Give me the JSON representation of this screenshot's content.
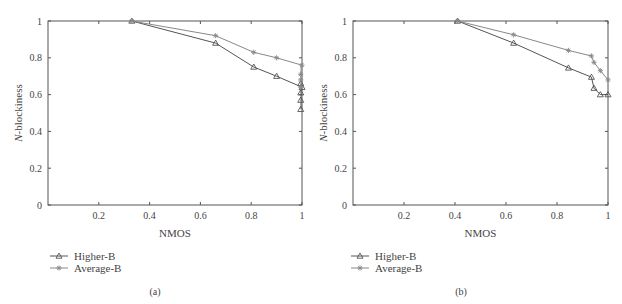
{
  "chart_data": [
    {
      "type": "line",
      "panel_label": "(a)",
      "title": "",
      "xlabel": "NMOS",
      "ylabel": "N-blockiness",
      "xlim": [
        0,
        1
      ],
      "ylim": [
        0,
        1
      ],
      "xticks": [
        "0.2",
        "0.4",
        "0.6",
        "0.8",
        "1"
      ],
      "yticks": [
        "0",
        "0.2",
        "0.4",
        "0.6",
        "0.8",
        "1"
      ],
      "grid": false,
      "legend_position": "below-left",
      "series": [
        {
          "name": "Higher-B",
          "marker": "triangle",
          "points": [
            [
              0.33,
              1.0
            ],
            [
              0.66,
              0.88
            ],
            [
              0.81,
              0.75
            ],
            [
              0.9,
              0.7
            ],
            [
              1.0,
              0.64
            ],
            [
              0.995,
              0.66
            ],
            [
              0.995,
              0.61
            ],
            [
              0.995,
              0.57
            ],
            [
              0.995,
              0.52
            ]
          ]
        },
        {
          "name": "Average-B",
          "marker": "star",
          "points": [
            [
              0.33,
              1.0
            ],
            [
              0.66,
              0.92
            ],
            [
              0.81,
              0.83
            ],
            [
              0.9,
              0.8
            ],
            [
              1.0,
              0.76
            ],
            [
              0.995,
              0.71
            ],
            [
              0.995,
              0.68
            ],
            [
              0.995,
              0.64
            ]
          ]
        }
      ]
    },
    {
      "type": "line",
      "panel_label": "(b)",
      "title": "",
      "xlabel": "NMOS",
      "ylabel": "N-blockiness",
      "xlim": [
        0,
        1
      ],
      "ylim": [
        0,
        1
      ],
      "xticks": [
        "0.2",
        "0.4",
        "0.6",
        "0.8",
        "1"
      ],
      "yticks": [
        "0",
        "0.2",
        "0.4",
        "0.6",
        "0.8",
        "1"
      ],
      "grid": false,
      "legend_position": "below-left",
      "series": [
        {
          "name": "Higher-B",
          "marker": "triangle",
          "points": [
            [
              0.41,
              1.0
            ],
            [
              0.63,
              0.88
            ],
            [
              0.845,
              0.745
            ],
            [
              0.935,
              0.695
            ],
            [
              0.945,
              0.635
            ],
            [
              0.97,
              0.6
            ],
            [
              1.0,
              0.6
            ]
          ]
        },
        {
          "name": "Average-B",
          "marker": "star",
          "points": [
            [
              0.41,
              1.0
            ],
            [
              0.63,
              0.925
            ],
            [
              0.845,
              0.84
            ],
            [
              0.935,
              0.81
            ],
            [
              0.945,
              0.775
            ],
            [
              0.97,
              0.73
            ],
            [
              1.0,
              0.68
            ]
          ]
        }
      ]
    }
  ],
  "panels": [
    {
      "caption": "(a)",
      "xlabel": "NMOS",
      "ylabel_italic": "N",
      "ylabel_rest": "-blockiness",
      "legend": [
        "Higher-B",
        "Average-B"
      ]
    },
    {
      "caption": "(b)",
      "xlabel": "NMOS",
      "ylabel_italic": "N",
      "ylabel_rest": "-blockiness",
      "legend": [
        "Higher-B",
        "Average-B"
      ]
    }
  ],
  "colors": {
    "axis": "#555555",
    "higher_b": "#555555",
    "average_b": "#888888"
  }
}
